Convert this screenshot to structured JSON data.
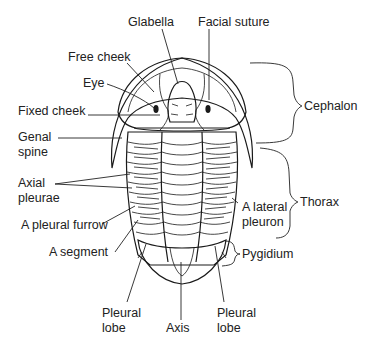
{
  "diagram": {
    "labels": {
      "glabella": "Glabella",
      "facial_suture": "Facial suture",
      "free_cheek": "Free cheek",
      "eye": "Eye",
      "fixed_cheek": "Fixed cheek",
      "genal_spine_1": "Genal",
      "genal_spine_2": "spine",
      "axial_pleurae_1": "Axial",
      "axial_pleurae_2": "pleurae",
      "pleural_furrow": "A pleural furrow",
      "segment": "A segment",
      "pleural_lobe_left_1": "Pleural",
      "pleural_lobe_left_2": "lobe",
      "axis": "Axis",
      "pleural_lobe_right_1": "Pleural",
      "pleural_lobe_right_2": "lobe",
      "lateral_pleuron_1": "A lateral",
      "lateral_pleuron_2": "pleuron"
    },
    "regions": {
      "cephalon": "Cephalon",
      "thorax": "Thorax",
      "pygidium": "Pygidium"
    },
    "colors": {
      "ink": "#1a1a1a",
      "stipple": "#9a9a9a",
      "background": "#ffffff"
    }
  }
}
